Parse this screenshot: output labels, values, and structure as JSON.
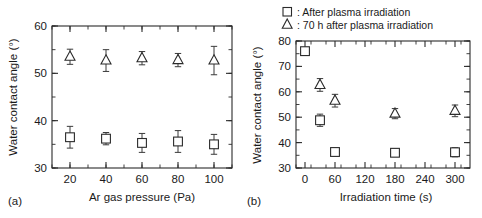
{
  "figure": {
    "panel_a_label": "(a)",
    "panel_b_label": "(b)",
    "marker_square": "square-marker-icon",
    "marker_triangle": "triangle-marker-icon",
    "legend": {
      "position": "top-right",
      "entries": [
        {
          "symbol": "square",
          "separator": ": ",
          "label": "After plasma irradiation"
        },
        {
          "symbol": "triangle",
          "separator": ": ",
          "label": "70 h after plasma irradiation"
        }
      ]
    }
  },
  "chart_data": [
    {
      "type": "scatter",
      "panel": "(a)",
      "title": "",
      "xlabel": "Ar gas pressure (Pa)",
      "ylabel": "Water contact angle (°)",
      "xlim": [
        10,
        110
      ],
      "ylim": [
        30,
        60
      ],
      "xticks": [
        20,
        40,
        60,
        80,
        100
      ],
      "xtick_labels": [
        "20",
        "40",
        "60",
        "80",
        "100"
      ],
      "yticks": [
        30,
        40,
        50,
        60
      ],
      "ytick_labels": [
        "30",
        "40",
        "50",
        "60"
      ],
      "x_minor_step": 10,
      "y_minor_step": 5,
      "grid": false,
      "legend": "none",
      "x": [
        20,
        40,
        60,
        80,
        100
      ],
      "series": [
        {
          "name": "After plasma irradiation",
          "symbol": "square",
          "values": [
            36.5,
            36.2,
            35.3,
            35.6,
            35.0
          ],
          "errors": [
            2.3,
            1.3,
            2.0,
            2.3,
            2.1
          ]
        },
        {
          "name": "70 h after plasma irradiation",
          "symbol": "triangle",
          "values": [
            53.5,
            52.7,
            53.2,
            52.8,
            52.7
          ],
          "errors": [
            1.6,
            2.3,
            1.4,
            1.4,
            3.0
          ]
        }
      ]
    },
    {
      "type": "scatter",
      "panel": "(b)",
      "title": "",
      "xlabel": "Irradiation time (s)",
      "ylabel": "Water contact angle (°)",
      "xlim": [
        -18,
        330
      ],
      "ylim": [
        30,
        80
      ],
      "xticks": [
        0,
        60,
        120,
        180,
        240,
        300
      ],
      "xtick_labels": [
        "0",
        "60",
        "120",
        "180",
        "240",
        "300"
      ],
      "yticks": [
        30,
        40,
        50,
        60,
        70,
        80
      ],
      "ytick_labels": [
        "30",
        "40",
        "50",
        "60",
        "70",
        "80"
      ],
      "x_minor_step": 30,
      "y_minor_step": 5,
      "grid": false,
      "legend": "none",
      "series": [
        {
          "name": "After plasma irradiation",
          "symbol": "square",
          "x": [
            0,
            30,
            60,
            180,
            300
          ],
          "values": [
            76.0,
            48.8,
            36.3,
            36.0,
            36.2
          ],
          "errors": [
            0,
            2.4,
            1.5,
            1.5,
            1.8
          ]
        },
        {
          "name": "70 h after plasma irradiation",
          "symbol": "triangle",
          "x": [
            30,
            60,
            180,
            300
          ],
          "values": [
            62.7,
            56.5,
            51.4,
            52.5
          ],
          "errors": [
            2.5,
            2.5,
            2.0,
            2.3
          ]
        }
      ]
    }
  ]
}
